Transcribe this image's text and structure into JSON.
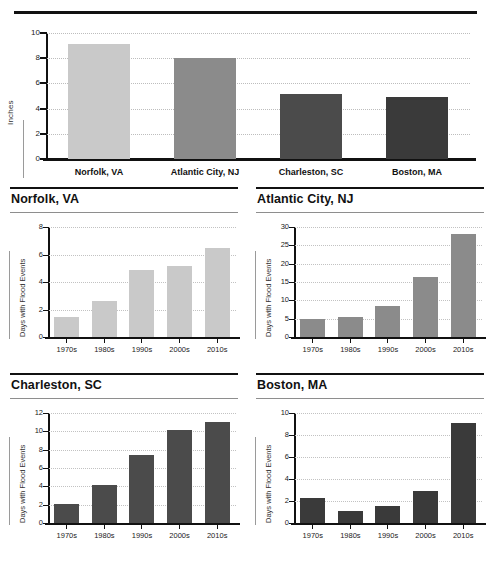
{
  "chart_data": [
    {
      "id": "overview",
      "type": "bar",
      "title": "",
      "xlabel": "",
      "ylabel": "Inches",
      "ylim": [
        0,
        10
      ],
      "yticks": [
        0,
        2,
        4,
        6,
        8,
        10
      ],
      "grid": true,
      "legend": "none",
      "categories": [
        "Norfolk, VA",
        "Atlantic City, NJ",
        "Charleston, SC",
        "Boston, MA"
      ],
      "values": [
        9.1,
        8.05,
        5.15,
        4.9
      ],
      "colors": [
        "#c9c9c9",
        "#8b8b8b",
        "#4b4b4b",
        "#3a3a3a"
      ]
    },
    {
      "id": "norfolk",
      "type": "bar",
      "title": "Norfolk, VA",
      "xlabel": "",
      "ylabel": "Days with Flood Events",
      "ylim": [
        0,
        8
      ],
      "yticks": [
        0,
        2,
        4,
        6,
        8
      ],
      "grid": true,
      "legend": "none",
      "categories": [
        "1970s",
        "1980s",
        "1990s",
        "2000s",
        "2010s"
      ],
      "values": [
        1.45,
        2.65,
        4.85,
        5.2,
        6.45
      ],
      "color": "#c9c9c9"
    },
    {
      "id": "atlantic-city",
      "type": "bar",
      "title": "Atlantic City, NJ",
      "xlabel": "",
      "ylabel": "Days with Flood Events",
      "ylim": [
        0,
        30
      ],
      "yticks": [
        0,
        5,
        10,
        15,
        20,
        25,
        30
      ],
      "grid": true,
      "legend": "none",
      "categories": [
        "1970s",
        "1980s",
        "1990s",
        "2000s",
        "2010s"
      ],
      "values": [
        4.8,
        5.4,
        8.4,
        16.3,
        28.0
      ],
      "color": "#8b8b8b"
    },
    {
      "id": "charleston",
      "type": "bar",
      "title": "Charleston, SC",
      "xlabel": "",
      "ylabel": "Days with Flood Events",
      "ylim": [
        0,
        12
      ],
      "yticks": [
        0,
        2,
        4,
        6,
        8,
        10,
        12
      ],
      "grid": true,
      "legend": "none",
      "categories": [
        "1970s",
        "1980s",
        "1990s",
        "2000s",
        "2010s"
      ],
      "values": [
        2.1,
        4.1,
        7.45,
        10.1,
        11.0
      ],
      "color": "#4b4b4b"
    },
    {
      "id": "boston",
      "type": "bar",
      "title": "Boston, MA",
      "xlabel": "",
      "ylabel": "Days with Flood Events",
      "ylim": [
        0,
        10
      ],
      "yticks": [
        0,
        2,
        4,
        6,
        8,
        10
      ],
      "grid": true,
      "legend": "none",
      "categories": [
        "1970s",
        "1980s",
        "1990s",
        "2000s",
        "2010s"
      ],
      "values": [
        2.3,
        1.1,
        1.55,
        2.9,
        9.1
      ],
      "color": "#3a3a3a"
    }
  ]
}
